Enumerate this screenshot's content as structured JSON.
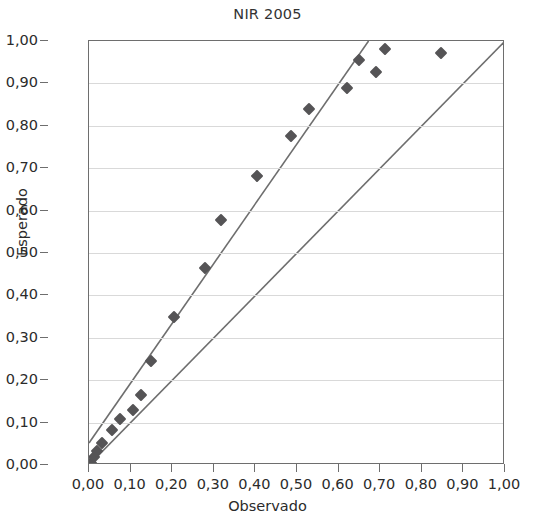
{
  "chart_data": {
    "type": "scatter",
    "title": "NIR 2005",
    "xlabel": "Observado",
    "ylabel": "Esperado",
    "xlim": [
      0.0,
      1.0
    ],
    "ylim": [
      0.0,
      1.0
    ],
    "grid": true,
    "legend": "none",
    "annotations": [
      {
        "name": "r2",
        "prefix": "R",
        "superscript": "2",
        "equals": "=",
        "value": "0,9641",
        "text": "R2= 0,9641"
      }
    ],
    "x_ticks": [
      "0,00",
      "0,10",
      "0,20",
      "0,30",
      "0,40",
      "0,50",
      "0,60",
      "0,70",
      "0,80",
      "0,90",
      "1,00"
    ],
    "x_tick_values": [
      0.0,
      0.1,
      0.2,
      0.3,
      0.4,
      0.5,
      0.6,
      0.7,
      0.8,
      0.9,
      1.0
    ],
    "y_ticks": [
      "0,00",
      "0,10",
      "0,20",
      "0,30",
      "0,40",
      "0,50",
      "0,60",
      "0,70",
      "0,80",
      "0,90",
      "1,00"
    ],
    "y_tick_values": [
      0.0,
      0.1,
      0.2,
      0.3,
      0.4,
      0.5,
      0.6,
      0.7,
      0.8,
      0.9,
      1.0
    ],
    "marker_color": "#555456",
    "line_color": "#6e6e6e",
    "grid_color": "#d9d9d9",
    "series": [
      {
        "name": "Observado vs Esperado",
        "marker": "diamond",
        "points": [
          {
            "x": 0.005,
            "y": 0.005
          },
          {
            "x": 0.012,
            "y": 0.018
          },
          {
            "x": 0.02,
            "y": 0.032
          },
          {
            "x": 0.032,
            "y": 0.052
          },
          {
            "x": 0.055,
            "y": 0.082
          },
          {
            "x": 0.075,
            "y": 0.108
          },
          {
            "x": 0.105,
            "y": 0.13
          },
          {
            "x": 0.125,
            "y": 0.165
          },
          {
            "x": 0.15,
            "y": 0.245
          },
          {
            "x": 0.205,
            "y": 0.348
          },
          {
            "x": 0.278,
            "y": 0.465
          },
          {
            "x": 0.318,
            "y": 0.578
          },
          {
            "x": 0.405,
            "y": 0.682
          },
          {
            "x": 0.485,
            "y": 0.775
          },
          {
            "x": 0.53,
            "y": 0.84
          },
          {
            "x": 0.62,
            "y": 0.89
          },
          {
            "x": 0.648,
            "y": 0.955
          },
          {
            "x": 0.69,
            "y": 0.928
          },
          {
            "x": 0.712,
            "y": 0.982
          },
          {
            "x": 0.845,
            "y": 0.972
          }
        ]
      }
    ],
    "lines": [
      {
        "name": "regression-line",
        "x0": 0.0,
        "y0": 0.052,
        "x1": 0.672,
        "y1": 1.0
      },
      {
        "name": "identity-line",
        "x0": 0.0,
        "y0": 0.0,
        "x1": 1.0,
        "y1": 1.0
      }
    ]
  }
}
